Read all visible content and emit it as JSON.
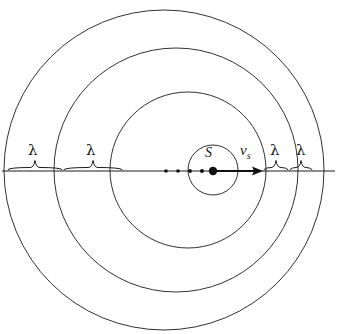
{
  "figure": {
    "type": "physics-diagram",
    "background_color": "#ffffff",
    "stroke_color": "#1a1a1a"
  },
  "labels": {
    "source": "S",
    "velocity_symbol": "v",
    "velocity_subscript": "s",
    "wavelength": "λ"
  },
  "wavefronts": [
    {
      "index": 1,
      "center_x": 164,
      "center_y": 170,
      "radius": 160,
      "name": "outermost-wavefront"
    },
    {
      "index": 2,
      "center_x": 176,
      "center_y": 170,
      "radius": 122,
      "name": "third-wavefront"
    },
    {
      "index": 3,
      "center_x": 188,
      "center_y": 170,
      "radius": 78,
      "name": "second-wavefront"
    },
    {
      "index": 4,
      "center_x": 213,
      "center_y": 170,
      "radius": 25,
      "name": "innermost-wavefront"
    }
  ],
  "axis": {
    "y": 171,
    "x_start": 2,
    "x_end": 335,
    "name": "horizontal-axis"
  },
  "source_positions": [
    {
      "x": 166,
      "r": 1.8
    },
    {
      "x": 178,
      "r": 1.8
    },
    {
      "x": 190,
      "r": 1.9
    },
    {
      "x": 202,
      "r": 2.0
    }
  ],
  "source_marker": {
    "x": 213,
    "y": 171,
    "r": 4.2
  },
  "velocity_arrow": {
    "x_start": 214,
    "x_end": 263,
    "y": 171
  },
  "wavelength_braces": [
    {
      "id": "lambda-left-outer",
      "x_start": 8,
      "x_end": 62,
      "label_x": 32,
      "side": "left"
    },
    {
      "id": "lambda-left-inner",
      "x_start": 64,
      "x_end": 122,
      "label_x": 90,
      "side": "left"
    },
    {
      "id": "lambda-right-inner",
      "x_start": 264,
      "x_end": 288,
      "label_x": 274,
      "side": "right"
    },
    {
      "id": "lambda-right-outer",
      "x_start": 290,
      "x_end": 312,
      "label_x": 300,
      "side": "right"
    }
  ],
  "label_positions": {
    "source": {
      "x": 205,
      "y": 146
    },
    "velocity": {
      "x": 240,
      "y": 143
    },
    "lambda_y": 143
  }
}
